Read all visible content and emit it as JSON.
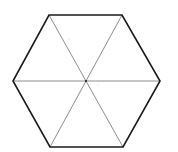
{
  "diagram": {
    "type": "regular-hexagon-divided",
    "vertices": [
      {
        "label": "",
        "x": 49,
        "y": 15
      },
      {
        "label": "",
        "x": 122,
        "y": 15
      },
      {
        "label": "",
        "x": 160,
        "y": 81
      },
      {
        "label": "",
        "x": 123,
        "y": 147
      },
      {
        "label": "",
        "x": 50,
        "y": 147
      },
      {
        "label": "",
        "x": 13,
        "y": 81
      }
    ],
    "center": {
      "x": 86,
      "y": 81
    },
    "diagonals": [
      {
        "from": 0,
        "to": 3
      },
      {
        "from": 1,
        "to": 4
      },
      {
        "from": 5,
        "to": 2
      }
    ],
    "colors": {
      "background": "#ffffff",
      "outline": "#1a1a1a",
      "diagonal": "#808080"
    },
    "stroke_widths": {
      "outline": 1.6,
      "diagonal": 0.9
    }
  }
}
